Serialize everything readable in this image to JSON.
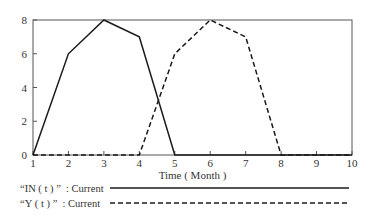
{
  "chart_data": {
    "type": "line",
    "title": "",
    "xlabel": "Time ( Month )",
    "ylabel": "",
    "xlim": [
      1,
      10
    ],
    "ylim": [
      0,
      8
    ],
    "x_ticks": [
      "1",
      "2",
      "3",
      "4",
      "5",
      "6",
      "7",
      "8",
      "9",
      "10"
    ],
    "y_ticks": [
      "0",
      "2",
      "4",
      "6",
      "8"
    ],
    "grid": false,
    "legend_position": "below",
    "x": [
      1,
      2,
      3,
      4,
      5,
      6,
      7,
      8,
      9,
      10
    ],
    "series": [
      {
        "name": "IN(t): Current",
        "style": "solid",
        "values": [
          0,
          6,
          8,
          7,
          0,
          0,
          0,
          0,
          0,
          0
        ]
      },
      {
        "name": "Y(t): Current",
        "style": "dashed",
        "values": [
          0,
          0,
          0,
          0,
          6,
          8,
          7,
          0,
          0,
          0
        ]
      }
    ]
  },
  "legend": {
    "items": [
      {
        "label": "“IN ( t ) ”  : Current",
        "style": "solid"
      },
      {
        "label": "“Y ( t ) ”  : Current",
        "style": "dashed"
      }
    ]
  },
  "colors": {
    "line": "#1a1a1a",
    "axis": "#555555"
  }
}
